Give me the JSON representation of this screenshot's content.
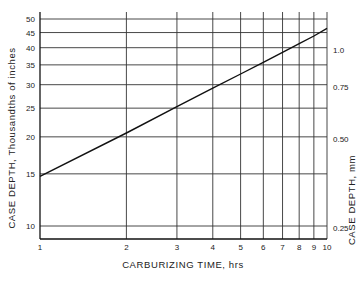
{
  "chart_data": {
    "type": "line",
    "title": "",
    "xlabel": "CARBURIZING TIME, hrs",
    "ylabel": "CASE DEPTH, Thousandths of inches",
    "ylabel_right": "CASE DEPTH, mm",
    "x_scale": "log",
    "y_scale": "log",
    "xlim": [
      1,
      10
    ],
    "ylim": [
      9,
      52
    ],
    "grid": true,
    "x_ticks": [
      "1",
      "2",
      "3",
      "4",
      "5",
      "6",
      "7",
      "8",
      "9",
      "10"
    ],
    "y_ticks": [
      "10",
      "15",
      "20",
      "25",
      "30",
      "35",
      "40",
      "45",
      "50"
    ],
    "y_ticks_right": [
      "0.25",
      "0.50",
      "0.75",
      "1.0"
    ],
    "series": [
      {
        "name": "Case depth",
        "x": [
          1,
          2,
          3,
          4,
          5,
          6,
          7,
          8,
          9,
          10
        ],
        "values": [
          14.7,
          20.6,
          25.3,
          29.2,
          32.6,
          35.7,
          38.6,
          41.3,
          43.8,
          46.5
        ]
      }
    ]
  }
}
